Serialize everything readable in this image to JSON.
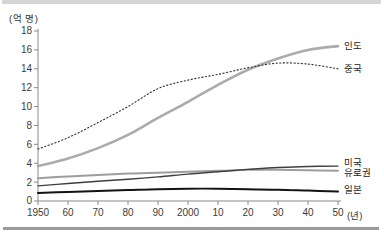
{
  "figure": {
    "background": "#ffffff",
    "top_bar_color": "#d5d5d5",
    "bottom_bar_color": "#9b9b9b"
  },
  "chart_data": {
    "type": "line",
    "title": "",
    "ylabel": "(억 명)",
    "xlabel": "(년)",
    "x": [
      1950,
      1960,
      1970,
      1980,
      1990,
      2000,
      2010,
      2020,
      2030,
      2040,
      2050
    ],
    "x_tick_labels": [
      "1950",
      "60",
      "70",
      "80",
      "90",
      "2000",
      "10",
      "20",
      "30",
      "40",
      "50"
    ],
    "y_ticks": [
      0,
      2,
      4,
      6,
      8,
      10,
      12,
      14,
      16,
      18
    ],
    "ylim": [
      0,
      18
    ],
    "xlim": [
      1950,
      2050
    ],
    "grid": false,
    "legend_position": "right of line ends",
    "axis_color": "#8a8a8a",
    "tick_label_color": "#3c3c3c",
    "series": [
      {
        "id": "india",
        "name": "인도",
        "style": "solid",
        "color": "#ababab",
        "thickness": 2.6,
        "values": [
          3.7,
          4.5,
          5.6,
          7.0,
          8.8,
          10.5,
          12.3,
          13.9,
          15.1,
          16.0,
          16.4
        ]
      },
      {
        "id": "china",
        "name": "중국",
        "style": "dotted",
        "color": "#2e2e2e",
        "thickness": 1.1,
        "values": [
          5.5,
          6.7,
          8.3,
          10.0,
          11.9,
          12.8,
          13.4,
          14.1,
          14.6,
          14.5,
          14.0
        ]
      },
      {
        "id": "usa",
        "name": "미국",
        "style": "solid",
        "color": "#3f3f3f",
        "thickness": 1.4,
        "values": [
          1.6,
          1.85,
          2.1,
          2.3,
          2.55,
          2.85,
          3.1,
          3.35,
          3.55,
          3.65,
          3.7
        ]
      },
      {
        "id": "eurozone",
        "name": "유로권",
        "style": "solid",
        "color": "#9d9d9d",
        "thickness": 2.0,
        "values": [
          2.4,
          2.6,
          2.75,
          2.9,
          3.0,
          3.1,
          3.2,
          3.3,
          3.3,
          3.25,
          3.2
        ]
      },
      {
        "id": "japan",
        "name": "일본",
        "style": "solid",
        "color": "#131313",
        "thickness": 2.0,
        "values": [
          0.85,
          0.95,
          1.05,
          1.15,
          1.25,
          1.3,
          1.3,
          1.25,
          1.2,
          1.1,
          1.0
        ]
      }
    ]
  }
}
